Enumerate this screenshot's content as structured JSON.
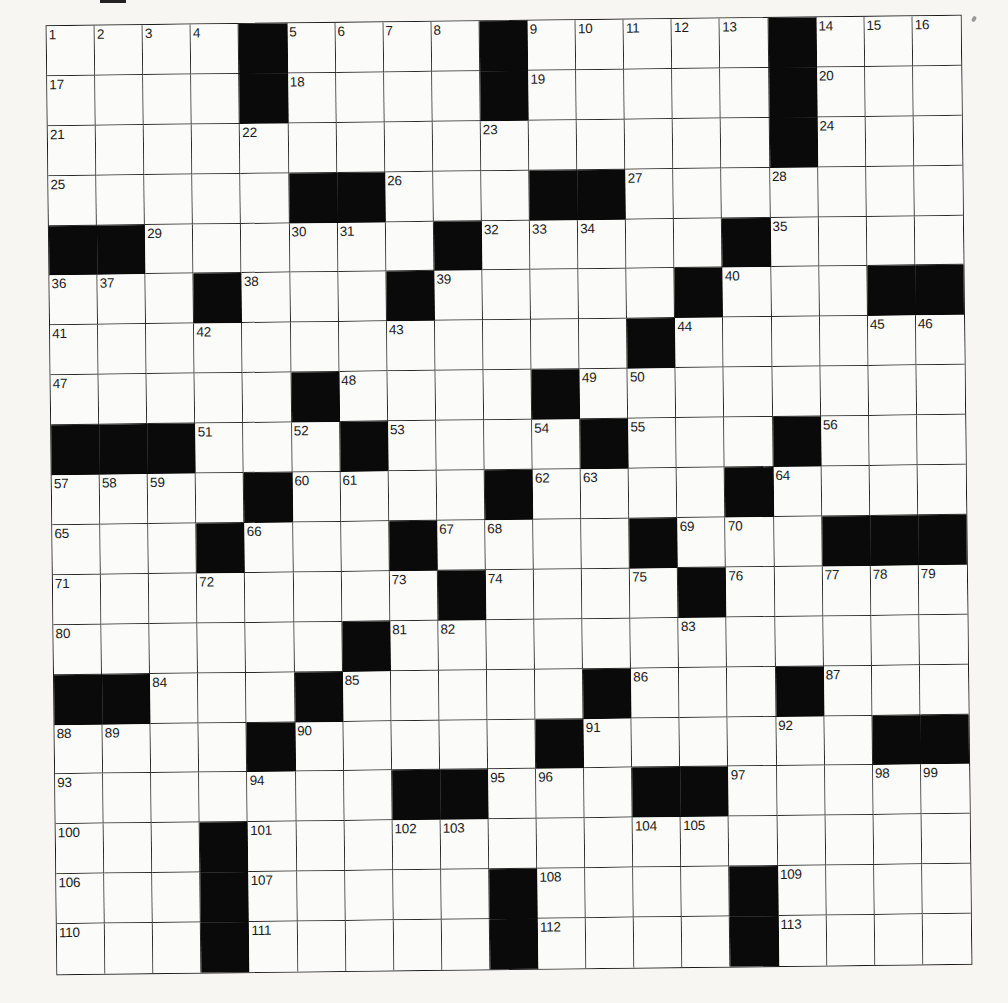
{
  "puzzle": {
    "type": "crossword",
    "rows": 19,
    "cols": 19,
    "block_marker": "#",
    "colors": {
      "block": "#0a0a0a",
      "cell": "#fbfbf9",
      "line": "#2a2a2a",
      "paper": "#f7f6f3"
    },
    "grid": [
      [
        "1",
        "2",
        "3",
        "4",
        "#",
        "5",
        "6",
        "7",
        "8",
        "#",
        "9",
        "10",
        "11",
        "12",
        "13",
        "#",
        "14",
        "15",
        "16"
      ],
      [
        "17",
        "",
        "",
        "",
        "#",
        "18",
        "",
        "",
        "",
        "#",
        "19",
        "",
        "",
        "",
        "",
        "#",
        "20",
        "",
        ""
      ],
      [
        "21",
        "",
        "",
        "",
        "22",
        "",
        "",
        "",
        "",
        "23",
        "",
        "",
        "",
        "",
        "",
        "#",
        "24",
        "",
        ""
      ],
      [
        "25",
        "",
        "",
        "",
        "",
        "#",
        "#",
        "26",
        "",
        "",
        "#",
        "#",
        "27",
        "",
        "",
        "28",
        "",
        "",
        ""
      ],
      [
        "#",
        "#",
        "29",
        "",
        "",
        "30",
        "31",
        "",
        "#",
        "32",
        "33",
        "34",
        "",
        "",
        "#",
        "35",
        "",
        "",
        ""
      ],
      [
        "36",
        "37",
        "",
        "#",
        "38",
        "",
        "",
        "#",
        "39",
        "",
        "",
        "",
        "",
        "#",
        "40",
        "",
        "",
        "#",
        "#"
      ],
      [
        "41",
        "",
        "",
        "42",
        "",
        "",
        "",
        "43",
        "",
        "",
        "",
        "",
        "#",
        "44",
        "",
        "",
        "",
        "45",
        "46"
      ],
      [
        "47",
        "",
        "",
        "",
        "",
        "#",
        "48",
        "",
        "",
        "",
        "#",
        "49",
        "50",
        "",
        "",
        "",
        "",
        "",
        ""
      ],
      [
        "#",
        "#",
        "#",
        "51",
        "",
        "52",
        "#",
        "53",
        "",
        "",
        "54",
        "#",
        "55",
        "",
        "",
        "#",
        "56",
        "",
        ""
      ],
      [
        "57",
        "58",
        "59",
        "",
        "#",
        "60",
        "61",
        "",
        "",
        "#",
        "62",
        "63",
        "",
        "",
        "#",
        "64",
        "",
        "",
        ""
      ],
      [
        "65",
        "",
        "",
        "#",
        "66",
        "",
        "",
        "#",
        "67",
        "68",
        "",
        "",
        "#",
        "69",
        "70",
        "",
        "#",
        "#",
        "#"
      ],
      [
        "71",
        "",
        "",
        "72",
        "",
        "",
        "",
        "73",
        "#",
        "74",
        "",
        "",
        "75",
        "#",
        "76",
        "",
        "77",
        "78",
        "79"
      ],
      [
        "80",
        "",
        "",
        "",
        "",
        "",
        "#",
        "81",
        "82",
        "",
        "",
        "",
        "",
        "83",
        "",
        "",
        "",
        "",
        ""
      ],
      [
        "#",
        "#",
        "84",
        "",
        "",
        "#",
        "85",
        "",
        "",
        "",
        "",
        "#",
        "86",
        "",
        "",
        "#",
        "87",
        "",
        ""
      ],
      [
        "88",
        "89",
        "",
        "",
        "#",
        "90",
        "",
        "",
        "",
        "",
        "#",
        "91",
        "",
        "",
        "",
        "92",
        "",
        "#",
        "#"
      ],
      [
        "93",
        "",
        "",
        "",
        "94",
        "",
        "",
        "#",
        "#",
        "95",
        "96",
        "",
        "#",
        "#",
        "97",
        "",
        "",
        "98",
        "99"
      ],
      [
        "100",
        "",
        "",
        "#",
        "101",
        "",
        "",
        "102",
        "103",
        "",
        "",
        "",
        "104",
        "105",
        "",
        "",
        "",
        "",
        ""
      ],
      [
        "106",
        "",
        "",
        "#",
        "107",
        "",
        "",
        "",
        "",
        "#",
        "108",
        "",
        "",
        "",
        "#",
        "109",
        "",
        "",
        ""
      ],
      [
        "110",
        "",
        "",
        "#",
        "111",
        "",
        "",
        "",
        "",
        "#",
        "112",
        "",
        "",
        "",
        "#",
        "113",
        "",
        "",
        ""
      ]
    ],
    "entries": {}
  }
}
